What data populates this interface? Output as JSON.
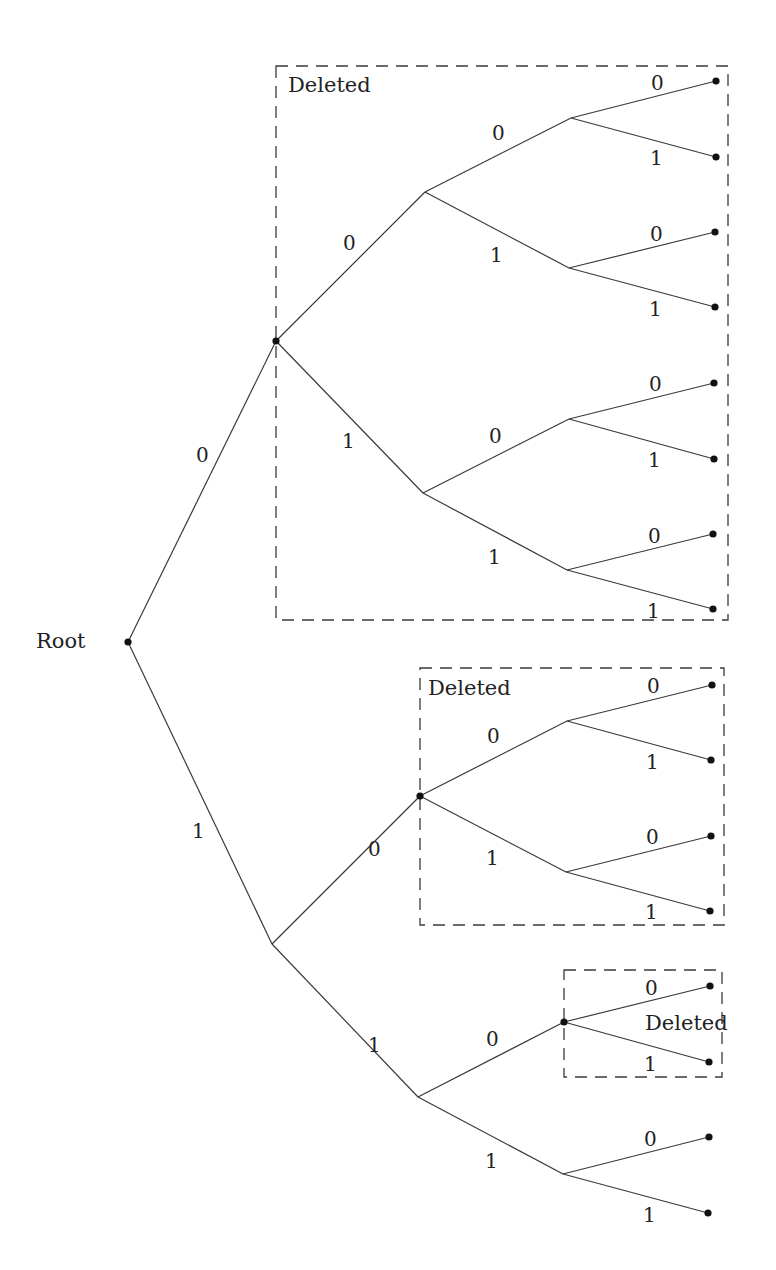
{
  "diagram": {
    "type": "binary-tree",
    "root_label": "Root",
    "deleted_label": "Deleted",
    "colors": {
      "line": "#3a3a3a",
      "node": "#111111",
      "text": "#222222",
      "background": "#ffffff"
    },
    "nodes": [
      {
        "id": "root",
        "x": 128,
        "y": 642,
        "dot": true
      },
      {
        "id": "0",
        "x": 276,
        "y": 341,
        "dot": true
      },
      {
        "id": "1",
        "x": 272,
        "y": 944,
        "dot": false
      },
      {
        "id": "00",
        "x": 425,
        "y": 192,
        "dot": false
      },
      {
        "id": "01",
        "x": 423,
        "y": 493,
        "dot": false
      },
      {
        "id": "10",
        "x": 420,
        "y": 796,
        "dot": true
      },
      {
        "id": "11",
        "x": 418,
        "y": 1097,
        "dot": false
      },
      {
        "id": "000",
        "x": 571,
        "y": 118,
        "dot": false
      },
      {
        "id": "001",
        "x": 569,
        "y": 268,
        "dot": false
      },
      {
        "id": "010",
        "x": 569,
        "y": 419,
        "dot": false
      },
      {
        "id": "011",
        "x": 567,
        "y": 570,
        "dot": false
      },
      {
        "id": "100",
        "x": 567,
        "y": 721,
        "dot": false
      },
      {
        "id": "101",
        "x": 566,
        "y": 872,
        "dot": false
      },
      {
        "id": "110",
        "x": 564,
        "y": 1022,
        "dot": true
      },
      {
        "id": "111",
        "x": 563,
        "y": 1174,
        "dot": false
      },
      {
        "id": "0000",
        "x": 716,
        "y": 81,
        "dot": true
      },
      {
        "id": "0001",
        "x": 716,
        "y": 157,
        "dot": true
      },
      {
        "id": "0010",
        "x": 715,
        "y": 232,
        "dot": true
      },
      {
        "id": "0011",
        "x": 715,
        "y": 307,
        "dot": true
      },
      {
        "id": "0100",
        "x": 714,
        "y": 383,
        "dot": true
      },
      {
        "id": "0101",
        "x": 714,
        "y": 459,
        "dot": true
      },
      {
        "id": "0110",
        "x": 713,
        "y": 534,
        "dot": true
      },
      {
        "id": "0111",
        "x": 713,
        "y": 609,
        "dot": true
      },
      {
        "id": "1000",
        "x": 712,
        "y": 685,
        "dot": true
      },
      {
        "id": "1001",
        "x": 711,
        "y": 760,
        "dot": true
      },
      {
        "id": "1010",
        "x": 711,
        "y": 836,
        "dot": true
      },
      {
        "id": "1011",
        "x": 710,
        "y": 911,
        "dot": true
      },
      {
        "id": "1100",
        "x": 710,
        "y": 986,
        "dot": true
      },
      {
        "id": "1101",
        "x": 709,
        "y": 1062,
        "dot": true
      },
      {
        "id": "1110",
        "x": 709,
        "y": 1137,
        "dot": true
      },
      {
        "id": "1111",
        "x": 708,
        "y": 1213,
        "dot": true
      }
    ],
    "edges": [
      {
        "from": "root",
        "to": "0",
        "label": "0",
        "lx": 196,
        "ly": 462
      },
      {
        "from": "root",
        "to": "1",
        "label": "1",
        "lx": 192,
        "ly": 838
      },
      {
        "from": "0",
        "to": "00",
        "label": "0",
        "lx": 343,
        "ly": 250
      },
      {
        "from": "0",
        "to": "01",
        "label": "1",
        "lx": 342,
        "ly": 448
      },
      {
        "from": "1",
        "to": "10",
        "label": "0",
        "lx": 368,
        "ly": 856
      },
      {
        "from": "1",
        "to": "11",
        "label": "1",
        "lx": 368,
        "ly": 1052
      },
      {
        "from": "00",
        "to": "000",
        "label": "0",
        "lx": 492,
        "ly": 140
      },
      {
        "from": "00",
        "to": "001",
        "label": "1",
        "lx": 490,
        "ly": 262
      },
      {
        "from": "01",
        "to": "010",
        "label": "0",
        "lx": 489,
        "ly": 443
      },
      {
        "from": "01",
        "to": "011",
        "label": "1",
        "lx": 488,
        "ly": 564
      },
      {
        "from": "10",
        "to": "100",
        "label": "0",
        "lx": 487,
        "ly": 743
      },
      {
        "from": "10",
        "to": "101",
        "label": "1",
        "lx": 486,
        "ly": 865
      },
      {
        "from": "11",
        "to": "110",
        "label": "0",
        "lx": 486,
        "ly": 1046
      },
      {
        "from": "11",
        "to": "111",
        "label": "1",
        "lx": 485,
        "ly": 1168
      },
      {
        "from": "000",
        "to": "0000",
        "label": "0",
        "lx": 651,
        "ly": 90
      },
      {
        "from": "000",
        "to": "0001",
        "label": "1",
        "lx": 650,
        "ly": 165
      },
      {
        "from": "001",
        "to": "0010",
        "label": "0",
        "lx": 650,
        "ly": 241
      },
      {
        "from": "001",
        "to": "0011",
        "label": "1",
        "lx": 649,
        "ly": 316
      },
      {
        "from": "010",
        "to": "0100",
        "label": "0",
        "lx": 649,
        "ly": 391
      },
      {
        "from": "010",
        "to": "0101",
        "label": "1",
        "lx": 648,
        "ly": 467
      },
      {
        "from": "011",
        "to": "0110",
        "label": "0",
        "lx": 648,
        "ly": 543
      },
      {
        "from": "011",
        "to": "0111",
        "label": "1",
        "lx": 647,
        "ly": 618
      },
      {
        "from": "100",
        "to": "1000",
        "label": "0",
        "lx": 647,
        "ly": 693
      },
      {
        "from": "100",
        "to": "1001",
        "label": "1",
        "lx": 646,
        "ly": 769
      },
      {
        "from": "101",
        "to": "1010",
        "label": "0",
        "lx": 646,
        "ly": 844
      },
      {
        "from": "101",
        "to": "1011",
        "label": "1",
        "lx": 645,
        "ly": 919
      },
      {
        "from": "110",
        "to": "1100",
        "label": "0",
        "lx": 645,
        "ly": 995
      },
      {
        "from": "110",
        "to": "1101",
        "label": "1",
        "lx": 644,
        "ly": 1071
      },
      {
        "from": "111",
        "to": "1110",
        "label": "0",
        "lx": 644,
        "ly": 1146
      },
      {
        "from": "111",
        "to": "1111",
        "label": "1",
        "lx": 643,
        "ly": 1222
      }
    ],
    "deleted_boxes": [
      {
        "id": "box-subtree-0",
        "x": 276,
        "y": 66,
        "w": 452,
        "h": 554,
        "label": "Deleted",
        "lx": 288,
        "ly": 92
      },
      {
        "id": "box-subtree-10",
        "x": 420,
        "y": 668,
        "w": 304,
        "h": 257,
        "label": "Deleted",
        "lx": 428,
        "ly": 695
      },
      {
        "id": "box-subtree-110",
        "x": 564,
        "y": 970,
        "w": 158,
        "h": 107,
        "label": "Deleted",
        "lx": 645,
        "ly": 1030
      }
    ],
    "root_label_pos": {
      "x": 36,
      "y": 648
    }
  }
}
